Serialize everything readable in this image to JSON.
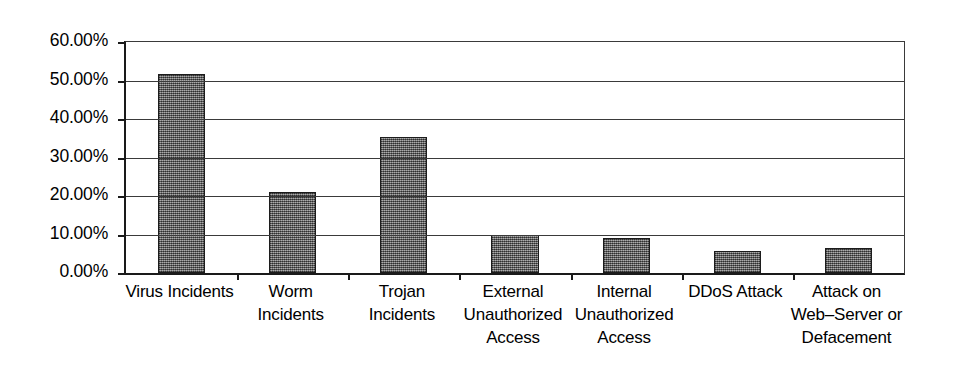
{
  "chart_data": {
    "type": "bar",
    "title": "",
    "subtitle": "",
    "xlabel": "",
    "ylabel": "",
    "ylim": [
      0,
      60
    ],
    "grid": true,
    "legend": false,
    "legend_position": "none",
    "y_tick_labels": [
      "60.00%",
      "50.00%",
      "40.00%",
      "30.00%",
      "20.00%",
      "10.00%",
      "0.00%"
    ],
    "y_tick_values": [
      60,
      50,
      40,
      30,
      20,
      10,
      0
    ],
    "value_suffix": "%",
    "categories": [
      "Virus Incidents",
      "Worm Incidents",
      "Trojan Incidents",
      "External Unauthorized Access",
      "Internal Unauthorized Access",
      "DDoS Attack",
      "Attack on Web–Server or Defacement"
    ],
    "category_label_lines": [
      [
        "Virus Incidents"
      ],
      [
        "Worm",
        "Incidents"
      ],
      [
        "Trojan",
        "Incidents"
      ],
      [
        "External",
        "Unauthorized",
        "Access"
      ],
      [
        "Internal",
        "Unauthorized",
        "Access"
      ],
      [
        "DDoS Attack"
      ],
      [
        "Attack on",
        "Web–Server or",
        "Defacement"
      ]
    ],
    "values": [
      51.8,
      21.0,
      35.2,
      10.0,
      9.2,
      5.7,
      6.6
    ],
    "colors": {
      "bar_fill": "#6f6f6f",
      "bar_outline": "#1c1c1c",
      "axis": "#1a1a1a",
      "gridline": "#3a3a3a",
      "background": "#ffffff",
      "text": "#000000"
    }
  }
}
